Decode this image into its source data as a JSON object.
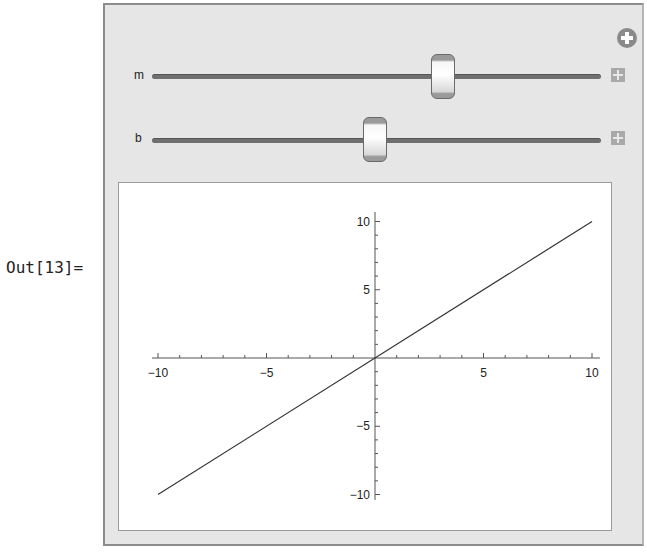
{
  "cell": {
    "output_label": "Out[13]="
  },
  "manipulate": {
    "add_button_icon": "circle-plus-icon",
    "controls": [
      {
        "label": "m",
        "value": 1,
        "min": -5,
        "max": 5,
        "thumb_x": 443,
        "track_y": 77,
        "expand_icon": "plus-box-icon"
      },
      {
        "label": "b",
        "value": 0,
        "min": -10,
        "max": 10,
        "thumb_x": 375,
        "track_y": 140,
        "expand_icon": "plus-box-icon"
      }
    ]
  },
  "chart_data": {
    "type": "line",
    "title": "",
    "xlabel": "",
    "ylabel": "",
    "xlim": [
      -10,
      10
    ],
    "ylim": [
      -10,
      10
    ],
    "grid": false,
    "legend": null,
    "x_ticks": [
      -10,
      -5,
      5,
      10
    ],
    "y_ticks": [
      -10,
      -5,
      5,
      10
    ],
    "x_tick_labels": [
      "−10",
      "−5",
      "5",
      "10"
    ],
    "y_tick_labels": [
      "−10",
      "−5",
      "5",
      "10"
    ],
    "series": [
      {
        "name": "m x + b",
        "x": [
          -10,
          10
        ],
        "y": [
          -10,
          10
        ]
      }
    ],
    "line_color": "#333333"
  }
}
